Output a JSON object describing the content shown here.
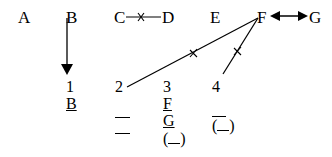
{
  "nodes": [
    {
      "id": "A",
      "label": "A"
    },
    {
      "id": "B",
      "label": "B"
    },
    {
      "id": "C",
      "label": "C"
    },
    {
      "id": "D",
      "label": "D"
    },
    {
      "id": "E",
      "label": "E"
    },
    {
      "id": "F",
      "label": "F"
    },
    {
      "id": "G",
      "label": "G"
    }
  ],
  "edges": [
    {
      "from": "B",
      "to": "1",
      "type": "arrow-down"
    },
    {
      "from": "C",
      "to": "D",
      "type": "blocked",
      "mark": "x"
    },
    {
      "from": "F",
      "to": "2",
      "type": "blocked",
      "mark": "x"
    },
    {
      "from": "F",
      "to": "4",
      "type": "blocked",
      "mark": "x"
    },
    {
      "from": "F",
      "to": "G",
      "type": "bidirectional"
    }
  ],
  "slots": [
    {
      "number": "1",
      "entries": [
        "B"
      ]
    },
    {
      "number": "2",
      "entries": [
        "",
        ""
      ]
    },
    {
      "number": "3",
      "entries": [
        "F",
        "G",
        "( )"
      ]
    },
    {
      "number": "4",
      "entries": [
        "",
        "( )"
      ]
    }
  ]
}
